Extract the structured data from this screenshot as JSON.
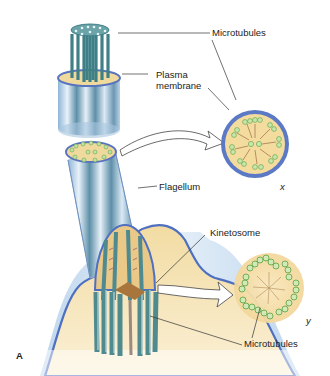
{
  "figure": {
    "panel_label": "A",
    "colors": {
      "membrane_blue": "#5b79c4",
      "pale_blue": "#c9dcef",
      "cytoplasm_yellow": "#f3dc9e",
      "microtubule_teal": "#4f8a8f",
      "microtubule_green": "#86c46a",
      "kinetosome_brown": "#a8763d"
    }
  },
  "labels": {
    "microtubules_top": "Microtubules",
    "plasma_membrane_line1": "Plasma",
    "plasma_membrane_line2": "membrane",
    "flagellum": "Flagellum",
    "kinetosome": "Kinetosome",
    "microtubules_bottom": "Microtubules",
    "section_x": "x",
    "section_y": "y"
  },
  "cross_sections": [
    {
      "id": "x",
      "description": "9+2 arrangement: nine outer doublets and two central microtubules, surrounded by plasma membrane"
    },
    {
      "id": "y",
      "description": "9x3 arrangement: nine triplets, no central pair (kinetosome)"
    }
  ]
}
